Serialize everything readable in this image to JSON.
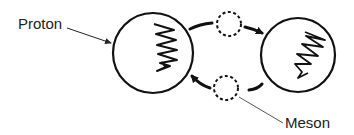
{
  "diagram": {
    "labels": {
      "proton": "Proton",
      "meson": "Meson"
    },
    "nodes": [
      {
        "id": "proton-left",
        "type": "proton",
        "cx": 153,
        "cy": 53,
        "r": 40
      },
      {
        "id": "proton-right",
        "type": "proton",
        "cx": 298,
        "cy": 55,
        "r": 37
      },
      {
        "id": "meson-top",
        "type": "meson",
        "cx": 229,
        "cy": 24,
        "r": 12,
        "style": "dashed"
      },
      {
        "id": "meson-bottom",
        "type": "meson",
        "cx": 226,
        "cy": 88,
        "r": 12,
        "style": "dashed"
      }
    ],
    "edges": [
      {
        "from": "proton-left",
        "to": "proton-right",
        "via": "meson-top",
        "direction": "left-to-right"
      },
      {
        "from": "proton-right",
        "to": "proton-left",
        "via": "meson-bottom",
        "direction": "right-to-left"
      }
    ],
    "colors": {
      "stroke": "#111111",
      "leader": "#555555",
      "text": "#222222",
      "background": "#ffffff"
    }
  }
}
